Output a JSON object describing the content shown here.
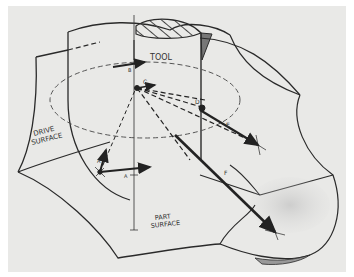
{
  "figure": {
    "type": "technical-illustration",
    "background": "#e9e9e7",
    "ink": "#2a2a2a",
    "labels": {
      "tool": "TOOL",
      "drive_surface_line1": "DRIVE",
      "drive_surface_line2": "SURFACE",
      "part_surface_line1": "PART",
      "part_surface_line2": "SURFACE"
    },
    "vectors": [
      {
        "id": "A",
        "label": "A"
      },
      {
        "id": "B",
        "label": "B"
      },
      {
        "id": "C",
        "label": "C"
      },
      {
        "id": "D",
        "label": "D"
      },
      {
        "id": "E",
        "label": "E"
      },
      {
        "id": "F",
        "label": "F"
      }
    ]
  }
}
